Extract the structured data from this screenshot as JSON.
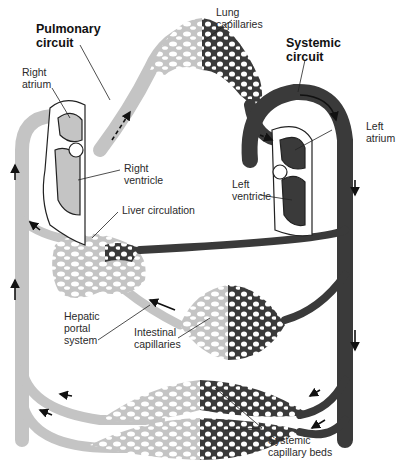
{
  "diagram": {
    "type": "circulatory-system-schematic",
    "colors": {
      "deoxygenated": "#c4c4c4",
      "oxygenated": "#3a3a3a",
      "outline": "#222222",
      "background": "#ffffff"
    }
  },
  "labels": {
    "pulmonary_circuit": {
      "line1": "Pulmonary",
      "line2": "circuit"
    },
    "lung_capillaries": {
      "line1": "Lung",
      "line2": "capillaries"
    },
    "systemic_circuit": {
      "line1": "Systemic",
      "line2": "circuit"
    },
    "right_atrium": {
      "line1": "Right",
      "line2": "atrium"
    },
    "right_ventricle": {
      "line1": "Right",
      "line2": "ventricle"
    },
    "left_atrium": {
      "line1": "Left",
      "line2": "atrium"
    },
    "left_ventricle": {
      "line1": "Left",
      "line2": "ventricle"
    },
    "liver_circulation": {
      "line1": "Liver circulation"
    },
    "hepatic_portal_system": {
      "line1": "Hepatic",
      "line2": "portal",
      "line3": "system"
    },
    "intestinal_capillaries": {
      "line1": "Intestinal",
      "line2": "capillaries"
    },
    "systemic_capillary_beds": {
      "line1": "Systemic",
      "line2": "capillary beds"
    }
  }
}
